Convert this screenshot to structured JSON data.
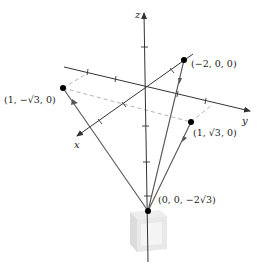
{
  "figure": {
    "axes": {
      "x_label": "x",
      "y_label": "y",
      "z_label": "z"
    },
    "points": [
      {
        "id": "p-neg2",
        "label": "(−2, 0, 0)"
      },
      {
        "id": "p-left",
        "label": "(1, −√3, 0)"
      },
      {
        "id": "p-right",
        "label": "(1, √3, 0)"
      },
      {
        "id": "p-bottom",
        "label": "(0, 0, −2√3)"
      }
    ],
    "colors": {
      "axis": "#333333",
      "line": "#555555",
      "dashed": "#aaaaaa",
      "point": "#000000",
      "cube_light": "#eeeeee",
      "cube_mid": "#dddddd",
      "cube_dark": "#cfcfcf"
    }
  }
}
